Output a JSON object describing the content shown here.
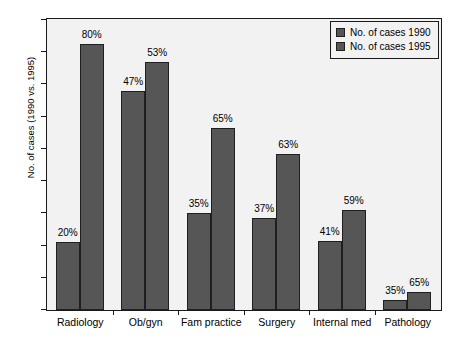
{
  "chart_data": {
    "type": "bar",
    "title": "",
    "xlabel": "",
    "ylabel": "No. of cases (1990 vs. 1995)",
    "ylim": [
      0,
      180
    ],
    "ytick_step": 20,
    "yticks": [
      0,
      20,
      40,
      60,
      80,
      100,
      120,
      140,
      160,
      180
    ],
    "grid": false,
    "legend_position": "top-right",
    "categories": [
      "Radiology",
      "Ob/gyn",
      "Fam practice",
      "Surgery",
      "Internal med",
      "Pathology"
    ],
    "series": [
      {
        "name": "No. of cases 1990",
        "values": [
          42,
          136,
          60,
          57,
          43,
          6
        ],
        "data_labels": [
          "20%",
          "47%",
          "35%",
          "37%",
          "41%",
          "35%"
        ],
        "color": "#565656"
      },
      {
        "name": "No. of cases 1995",
        "values": [
          165,
          154,
          113,
          97,
          62,
          11
        ],
        "data_labels": [
          "80%",
          "53%",
          "65%",
          "63%",
          "59%",
          "65%"
        ],
        "color": "#565656"
      }
    ]
  },
  "legend": {
    "items": [
      {
        "label": "No. of cases 1990"
      },
      {
        "label": "No. of cases 1995"
      }
    ]
  },
  "colors": {
    "bar": "#565656",
    "bar_border": "#1f1f1f",
    "plot_background": "#f2f2f2",
    "frame": "#1a1a1a",
    "page_background": "#ffffff",
    "text": "#000000"
  }
}
